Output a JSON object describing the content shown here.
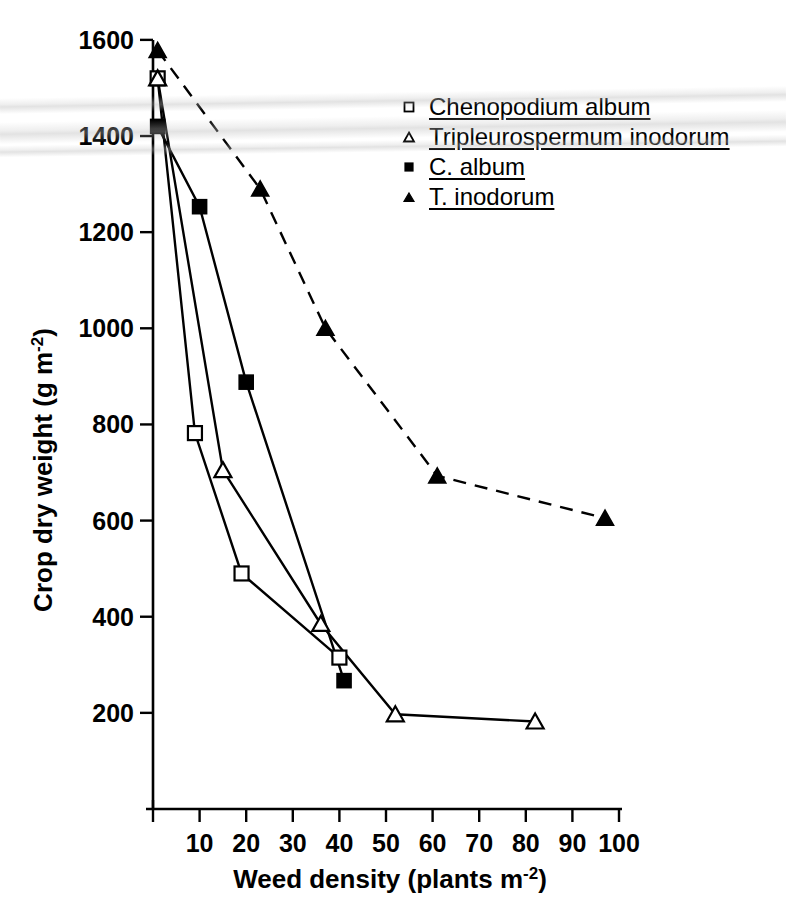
{
  "chart_data": {
    "type": "line",
    "title": "",
    "xlabel": "Weed density (plants m-2)",
    "xlabel_main": "Weed density (plants m",
    "xlabel_sup": "-2",
    "xlabel_tail": ")",
    "ylabel": "Crop dry weight (g m-2)",
    "ylabel_main": "Crop dry weight (g m",
    "ylabel_sup": "-2",
    "ylabel_tail": ")",
    "xlim": [
      0,
      103
    ],
    "ylim": [
      0,
      1680
    ],
    "xticks": [
      10,
      20,
      30,
      40,
      50,
      60,
      70,
      80,
      90,
      100
    ],
    "yticks": [
      200,
      400,
      600,
      800,
      1000,
      1200,
      1400,
      1600
    ],
    "grid": false,
    "legend_position": "upper-right",
    "series": [
      {
        "name": "Chenopodium album",
        "marker": "open-square",
        "line": "solid",
        "x": [
          1,
          9,
          19,
          40
        ],
        "y": [
          1520,
          782,
          490,
          315
        ]
      },
      {
        "name": "Tripleurospermum inodorum",
        "marker": "open-triangle",
        "line": "solid",
        "x": [
          1,
          15,
          36,
          52,
          82
        ],
        "y": [
          1520,
          705,
          385,
          197,
          182
        ]
      },
      {
        "name": "C. album",
        "marker": "filled-square",
        "line": "solid",
        "x": [
          1,
          10,
          20,
          41
        ],
        "y": [
          1420,
          1253,
          888,
          267
        ]
      },
      {
        "name": "T. inodorum",
        "marker": "filled-triangle",
        "line": "dashed",
        "x": [
          1,
          23,
          37,
          61,
          97
        ],
        "y": [
          1578,
          1290,
          1000,
          693,
          605
        ]
      }
    ]
  },
  "legend": {
    "items": [
      {
        "label": "Chenopodium album",
        "marker": "open-square"
      },
      {
        "label": "Tripleurospermum inodorum",
        "marker": "open-triangle"
      },
      {
        "label": "C. album",
        "marker": "filled-square"
      },
      {
        "label": "T. inodorum",
        "marker": "filled-triangle"
      }
    ]
  },
  "axes": {
    "y_tick_labels": [
      "1600",
      "1400",
      "1200",
      "1000",
      "800",
      "600",
      "400",
      "200"
    ],
    "x_tick_labels": [
      "10",
      "20",
      "30",
      "40",
      "50",
      "60",
      "70",
      "80",
      "90",
      "100"
    ]
  }
}
